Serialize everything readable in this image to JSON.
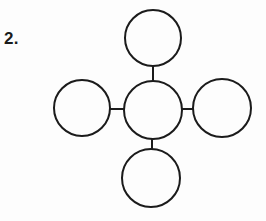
{
  "figure": {
    "item_number_label": "2.",
    "stroke_color": "#1b1b1b",
    "fill_color": "#fdfdfd",
    "background_color": "#fdfdfd",
    "stroke_width": 2,
    "nodes": [
      {
        "id": "top",
        "name": "top-circle",
        "label": "",
        "cx": 153,
        "cy": 38,
        "r": 28
      },
      {
        "id": "left",
        "name": "left-circle",
        "label": "",
        "cx": 82,
        "cy": 108,
        "r": 28
      },
      {
        "id": "center",
        "name": "center-circle",
        "label": "",
        "cx": 153,
        "cy": 110,
        "r": 29
      },
      {
        "id": "right",
        "name": "right-circle",
        "label": "",
        "cx": 222,
        "cy": 108,
        "r": 29
      },
      {
        "id": "bottom",
        "name": "bottom-circle",
        "label": "",
        "cx": 151,
        "cy": 178,
        "r": 29
      }
    ],
    "connectors": [
      {
        "id": "top-center",
        "name": "connector-top-center",
        "orientation": "vertical",
        "x1": 153,
        "y1": 66,
        "x2": 153,
        "y2": 82
      },
      {
        "id": "left-center",
        "name": "connector-left-center",
        "orientation": "horizontal",
        "x1": 110,
        "y1": 109,
        "x2": 125,
        "y2": 109
      },
      {
        "id": "center-right",
        "name": "connector-center-right",
        "orientation": "horizontal",
        "x1": 182,
        "y1": 109,
        "x2": 194,
        "y2": 109
      },
      {
        "id": "center-bottom",
        "name": "connector-center-bottom",
        "orientation": "vertical",
        "x1": 152,
        "y1": 139,
        "x2": 152,
        "y2": 150
      }
    ]
  }
}
